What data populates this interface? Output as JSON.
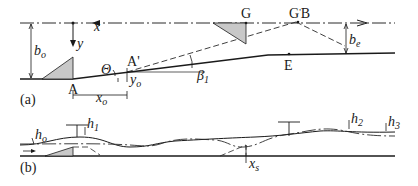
{
  "figure": {
    "panel_a": {
      "label": "(a)",
      "axis_x": "x",
      "axis_y": "y",
      "points": {
        "A": "A",
        "A_prime": "A",
        "A_prime_mark": "'",
        "G": "G",
        "G_prime": "G",
        "G_prime_mark": "'",
        "B": "B",
        "E": "E"
      },
      "dimensions": {
        "b_o": {
          "main": "b",
          "sub": "o"
        },
        "b_e": {
          "main": "b",
          "sub": "e"
        },
        "x_o": {
          "main": "x",
          "sub": "o"
        },
        "y_o": {
          "main": "y",
          "sub": "o"
        },
        "theta": "Θ",
        "beta_1": {
          "main": "β",
          "sub": "1"
        }
      }
    },
    "panel_b": {
      "label": "(b)",
      "dimensions": {
        "h_o": {
          "main": "h",
          "sub": "o"
        },
        "h_1": {
          "main": "h",
          "sub": "1"
        },
        "h_2": {
          "main": "h",
          "sub": "2"
        },
        "h_3": {
          "main": "h",
          "sub": "3"
        },
        "x_s": {
          "main": "x",
          "sub": "s"
        }
      }
    }
  }
}
